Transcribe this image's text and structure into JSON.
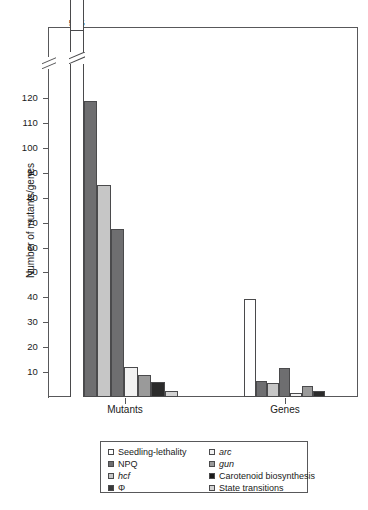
{
  "chart_data": {
    "type": "bar",
    "title": "",
    "xlabel": "",
    "ylabel": "Number of mutants/genes",
    "categories": [
      "Mutants",
      "Genes"
    ],
    "ylim": [
      0,
      125
    ],
    "ytick_labels": [
      "10",
      "20",
      "30",
      "40",
      "50",
      "60",
      "70",
      "80",
      "90",
      "100",
      "110",
      "120"
    ],
    "ytick_values": [
      10,
      20,
      30,
      40,
      50,
      60,
      70,
      80,
      90,
      100,
      110,
      120
    ],
    "axis_break": true,
    "axis_break_note": "y-axis is broken above 120; the Seedling-lethality mutants bar is truncated and labelled 505",
    "grid": false,
    "legend_position": "below-plot",
    "series": [
      {
        "name": "Seedling-lethality",
        "italic": false,
        "color": "#ffffff",
        "values": [
          505,
          39.5
        ],
        "data_labels": [
          "505",
          ""
        ]
      },
      {
        "name": "NPQ",
        "italic": false,
        "color": "#6e6e70",
        "values": [
          119,
          6.5
        ],
        "data_labels": [
          "",
          ""
        ]
      },
      {
        "name": "hcf",
        "italic": true,
        "color": "#c6c6c6",
        "values": [
          85,
          5.5
        ],
        "data_labels": [
          "",
          ""
        ]
      },
      {
        "name": "Φ",
        "italic": false,
        "color": "#6e6e70",
        "values": [
          67.5,
          11.5
        ],
        "data_labels": [
          "",
          ""
        ]
      },
      {
        "name": "arc",
        "italic": true,
        "color": "#f2f2f2",
        "values": [
          12,
          1.5
        ],
        "data_labels": [
          "",
          ""
        ]
      },
      {
        "name": "gun",
        "italic": true,
        "color": "#9a9a9a",
        "values": [
          9,
          4.5
        ],
        "data_labels": [
          "",
          ""
        ]
      },
      {
        "name": "Carotenoid biosynthesis",
        "italic": false,
        "color": "#2b2b2b",
        "values": [
          6,
          2.5
        ],
        "data_labels": [
          "",
          ""
        ]
      },
      {
        "name": "State transitions",
        "italic": false,
        "color": "#d2d2d2",
        "values": [
          2.5,
          0
        ],
        "data_labels": [
          "",
          ""
        ]
      }
    ]
  },
  "axis": {
    "y_title": "Number of mutants/genes",
    "ticks": [
      "120",
      "110",
      "100",
      "90",
      "80",
      "70",
      "60",
      "50",
      "40",
      "30",
      "20",
      "10"
    ],
    "group_labels": [
      "Mutants",
      "Genes"
    ]
  },
  "annotations": {
    "broken_bar_value": "505"
  },
  "legend": {
    "column_left": [
      {
        "label": "Seedling-lethality",
        "swatch": "#ffffff",
        "italic": false
      },
      {
        "label": "NPQ",
        "swatch": "#6e6e70",
        "italic": false
      },
      {
        "label": "hcf",
        "swatch": "#c6c6c6",
        "italic": true
      },
      {
        "label": "Φ",
        "swatch": "#3a3a3a",
        "italic": false
      }
    ],
    "column_right": [
      {
        "label": "arc",
        "swatch": "#f2f2f2",
        "italic": true
      },
      {
        "label": "gun",
        "swatch": "#9a9a9a",
        "italic": true
      },
      {
        "label": "Carotenoid biosynthesis",
        "swatch": "#1a1a1a",
        "italic": false
      },
      {
        "label": "State transitions",
        "swatch": "#d2d2d2",
        "italic": false
      }
    ]
  },
  "caption": {
    "cut_off_line": ""
  },
  "colors": {
    "axis": "#58585a",
    "bar_outline": "#4a4a4c",
    "text": "#1a1a1a",
    "background": "#ffffff"
  }
}
